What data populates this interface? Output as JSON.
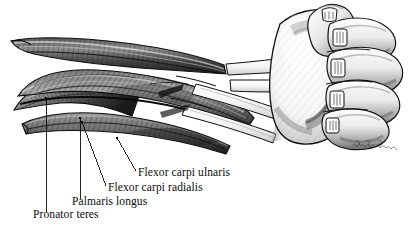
{
  "figure": {
    "medium": "pen-and-ink and graphite anatomical illustration",
    "view": "anterior (palmar / flexor) aspect of right forearm, hand clenched into a fist",
    "background_color": "#ffffff",
    "ink_color": "#111111",
    "width_px": 417,
    "height_px": 231
  },
  "labels": [
    {
      "id": "flexor-carpi-ulnaris",
      "text": "Flexor carpi ulnaris",
      "x": 138,
      "y": 166,
      "leader": {
        "x1": 136,
        "y1": 171,
        "x2": 117,
        "y2": 138
      }
    },
    {
      "id": "flexor-carpi-radialis",
      "text": "Flexor carpi radialis",
      "x": 108,
      "y": 181,
      "leader": {
        "x1": 106,
        "y1": 186,
        "x2": 82,
        "y2": 122
      }
    },
    {
      "id": "palmaris-longus",
      "text": "Palmaris longus",
      "x": 72,
      "y": 195,
      "leader": {
        "x1": 81,
        "y1": 199,
        "x2": 80,
        "y2": 118
      }
    },
    {
      "id": "pronator-teres",
      "text": "Pronator teres",
      "x": 33,
      "y": 208,
      "leader": {
        "x1": 46,
        "y1": 212,
        "x2": 46,
        "y2": 98
      }
    }
  ],
  "signature": {
    "present": true,
    "text": "",
    "description": "artist cursive signature, illegible at this resolution",
    "x": 352,
    "y": 136
  },
  "palette": {
    "paper": "#ffffff",
    "outline": "#111111",
    "muscle_dark": "#2b2b2b",
    "muscle_mid": "#6d6d6d",
    "muscle_light": "#b9b9b9",
    "tendon": "#f2f2f2",
    "skin_shadow": "#8e8e8e",
    "skin_light": "#fafafa",
    "label_text": "#0b0b0b"
  }
}
